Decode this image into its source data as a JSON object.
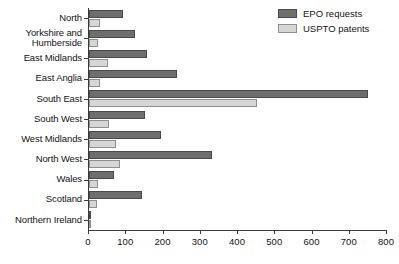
{
  "chart_data": {
    "type": "bar",
    "orientation": "horizontal",
    "title": "",
    "subtitle": "",
    "xlabel": "",
    "ylabel": "",
    "xlim": [
      0,
      800
    ],
    "xticks": [
      0,
      100,
      200,
      300,
      400,
      500,
      600,
      700,
      800
    ],
    "grid": false,
    "legend_position": "top-right",
    "categories": [
      "North",
      "Yorkshire and Humberside",
      "East Midlands",
      "East Anglia",
      "South East",
      "South West",
      "West Midlands",
      "North West",
      "Wales",
      "Scotland",
      "Northern Ireland"
    ],
    "category_lines": [
      [
        "North"
      ],
      [
        "Yorkshire and",
        "Humberside"
      ],
      [
        "East Midlands"
      ],
      [
        "East Anglia"
      ],
      [
        "South East"
      ],
      [
        "South West"
      ],
      [
        "West Midlands"
      ],
      [
        "North West"
      ],
      [
        "Wales"
      ],
      [
        "Scotland"
      ],
      [
        "Northern Ireland"
      ]
    ],
    "series": [
      {
        "name": "EPO requests",
        "color": "#6e6e6e",
        "values": [
          92,
          123,
          156,
          236,
          750,
          150,
          193,
          330,
          67,
          142,
          5
        ]
      },
      {
        "name": "USPTO patents",
        "color": "#d6d6d6",
        "values": [
          30,
          24,
          51,
          30,
          450,
          54,
          72,
          83,
          24,
          22,
          2
        ]
      }
    ]
  },
  "legend": {
    "items": [
      {
        "label": "EPO requests",
        "swatch": "epo"
      },
      {
        "label": "USPTO patents",
        "swatch": "uspto"
      }
    ]
  },
  "axis": {
    "x_tick_labels": [
      "0",
      "100",
      "200",
      "300",
      "400",
      "500",
      "600",
      "700",
      "800"
    ]
  }
}
